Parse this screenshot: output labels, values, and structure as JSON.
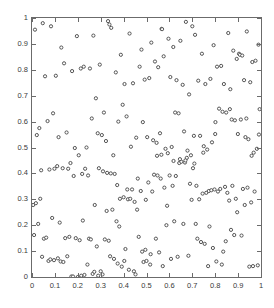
{
  "chart_data": {
    "type": "scatter",
    "title": "",
    "subtitle": "",
    "xlabel": "",
    "ylabel": "",
    "xlim": [
      0,
      1
    ],
    "ylim": [
      0,
      1
    ],
    "grid": false,
    "legend": null,
    "frame": "box",
    "tick_direction": "in",
    "marker": {
      "shape": "circle-open",
      "size_px": 3.2,
      "edge_color": "#555555",
      "face_color": "#ffffff",
      "edge_width": 1.0
    },
    "xticks": [
      0,
      0.1,
      0.2,
      0.3,
      0.4,
      0.5,
      0.6,
      0.7,
      0.8,
      0.9,
      1
    ],
    "yticks": [
      0,
      0.1,
      0.2,
      0.3,
      0.4,
      0.5,
      0.6,
      0.7,
      0.8,
      0.9,
      1
    ],
    "xticklabels": [
      "0",
      "0.1",
      "0.2",
      "0.3",
      "0.4",
      "0.5",
      "0.6",
      "0.7",
      "0.8",
      "0.9",
      "1"
    ],
    "yticklabels": [
      "0",
      "0.1",
      "0.2",
      "0.3",
      "0.4",
      "0.5",
      "0.6",
      "0.7",
      "0.8",
      "0.9",
      "1"
    ],
    "n_points": 252,
    "series": [
      {
        "name": "random-uniform-points",
        "x": [
          0.013,
          0.047,
          0.083,
          0.128,
          0.196,
          0.213,
          0.268,
          0.296,
          0.332,
          0.338,
          0.346,
          0.388,
          0.426,
          0.478,
          0.521,
          0.566,
          0.568,
          0.596,
          0.617,
          0.648,
          0.672,
          0.7,
          0.712,
          0.742,
          0.793,
          0.826,
          0.857,
          0.879,
          0.904,
          0.908,
          0.918,
          0.938,
          0.962,
          0.989,
          0.021,
          0.057,
          0.104,
          0.14,
          0.175,
          0.226,
          0.253,
          0.279,
          0.314,
          0.366,
          0.404,
          0.441,
          0.47,
          0.492,
          0.512,
          0.537,
          0.551,
          0.575,
          0.604,
          0.631,
          0.658,
          0.686,
          0.726,
          0.757,
          0.779,
          0.808,
          0.838,
          0.866,
          0.894,
          0.926,
          0.953,
          0.976,
          0.032,
          0.068,
          0.092,
          0.116,
          0.151,
          0.187,
          0.204,
          0.238,
          0.261,
          0.287,
          0.305,
          0.323,
          0.355,
          0.377,
          0.396,
          0.413,
          0.432,
          0.455,
          0.484,
          0.503,
          0.529,
          0.544,
          0.559,
          0.583,
          0.61,
          0.625,
          0.64,
          0.664,
          0.679,
          0.694,
          0.707,
          0.734,
          0.75,
          0.765,
          0.786,
          0.801,
          0.817,
          0.832,
          0.848,
          0.872,
          0.886,
          0.899,
          0.912,
          0.932,
          0.945,
          0.968,
          0.982,
          0.005,
          0.04,
          0.076,
          0.098,
          0.11,
          0.134,
          0.158,
          0.168,
          0.182,
          0.219,
          0.232,
          0.245,
          0.274,
          0.292,
          0.31,
          0.328,
          0.344,
          0.361,
          0.372,
          0.384,
          0.4,
          0.419,
          0.437,
          0.448,
          0.462,
          0.475,
          0.497,
          0.508,
          0.525,
          0.533,
          0.548,
          0.562,
          0.578,
          0.59,
          0.601,
          0.614,
          0.628,
          0.643,
          0.652,
          0.668,
          0.676,
          0.69,
          0.703,
          0.718,
          0.73,
          0.745,
          0.761,
          0.772,
          0.783,
          0.797,
          0.812,
          0.822,
          0.843,
          0.853,
          0.861,
          0.875,
          0.89,
          0.921,
          0.941,
          0.957,
          0.972,
          0.994,
          0.009,
          0.027,
          0.052,
          0.062,
          0.088,
          0.121,
          0.145,
          0.163,
          0.191,
          0.208,
          0.222,
          0.249,
          0.257,
          0.283,
          0.3,
          0.318,
          0.335,
          0.351,
          0.369,
          0.381,
          0.392,
          0.408,
          0.423,
          0.445,
          0.452,
          0.466,
          0.487,
          0.5,
          0.516,
          0.541,
          0.555,
          0.571,
          0.587,
          0.607,
          0.621,
          0.636,
          0.661,
          0.683,
          0.697,
          0.715,
          0.722,
          0.738,
          0.754,
          0.769,
          0.775,
          0.79,
          0.805,
          0.829,
          0.835,
          0.846,
          0.869,
          0.883,
          0.896,
          0.915,
          0.929,
          0.949,
          0.965,
          0.986,
          0.017,
          0.036,
          0.044,
          0.072,
          0.08,
          0.096,
          0.113,
          0.125,
          0.137,
          0.154,
          0.172,
          0.179,
          0.2,
          0.215,
          0.229,
          0.242,
          0.265,
          0.272,
          0.289,
          0.308,
          0.326,
          0.341,
          0.358,
          0.374,
          0.403,
          0.416,
          0.429,
          0.459,
          0.481,
          0.495,
          0.518,
          0.546,
          0.565,
          0.593,
          0.618,
          0.646,
          0.67,
          0.709,
          0.748,
          0.8,
          0.864,
          0.936,
          0.959,
          0.991
        ],
        "y": [
          0.955,
          0.98,
          0.968,
          0.886,
          0.93,
          0.805,
          0.932,
          0.82,
          0.988,
          0.975,
          0.962,
          0.858,
          0.94,
          0.878,
          0.905,
          0.958,
          0.957,
          0.92,
          0.888,
          0.912,
          0.985,
          0.968,
          0.935,
          0.862,
          0.895,
          0.815,
          0.942,
          0.874,
          0.862,
          0.858,
          0.855,
          0.948,
          0.83,
          0.897,
          0.548,
          0.775,
          0.777,
          0.825,
          0.795,
          0.812,
          0.805,
          0.69,
          0.635,
          0.79,
          0.745,
          0.748,
          0.812,
          0.762,
          0.768,
          0.832,
          0.81,
          0.852,
          0.772,
          0.76,
          0.742,
          0.705,
          0.758,
          0.745,
          0.765,
          0.812,
          0.745,
          0.725,
          0.842,
          0.76,
          0.752,
          0.835,
          0.575,
          0.602,
          0.632,
          0.54,
          0.558,
          0.498,
          0.47,
          0.5,
          0.612,
          0.555,
          0.548,
          0.525,
          0.47,
          0.6,
          0.665,
          0.62,
          0.503,
          0.538,
          0.598,
          0.54,
          0.528,
          0.518,
          0.555,
          0.495,
          0.502,
          0.635,
          0.632,
          0.562,
          0.488,
          0.47,
          0.545,
          0.545,
          0.505,
          0.492,
          0.52,
          0.598,
          0.65,
          0.638,
          0.635,
          0.608,
          0.605,
          0.552,
          0.608,
          0.54,
          0.532,
          0.48,
          0.495,
          0.278,
          0.412,
          0.415,
          0.418,
          0.428,
          0.42,
          0.418,
          0.44,
          0.39,
          0.398,
          0.418,
          0.392,
          0.278,
          0.42,
          0.408,
          0.402,
          0.4,
          0.398,
          0.355,
          0.302,
          0.308,
          0.3,
          0.338,
          0.29,
          0.38,
          0.332,
          0.298,
          0.365,
          0.33,
          0.395,
          0.392,
          0.38,
          0.345,
          0.275,
          0.392,
          0.352,
          0.39,
          0.44,
          0.445,
          0.442,
          0.46,
          0.36,
          0.42,
          0.352,
          0.3,
          0.322,
          0.325,
          0.332,
          0.335,
          0.338,
          0.33,
          0.34,
          0.348,
          0.325,
          0.295,
          0.352,
          0.302,
          0.34,
          0.345,
          0.288,
          0.33,
          0.648,
          0.162,
          0.205,
          0.148,
          0.152,
          0.228,
          0.21,
          0.15,
          0.155,
          0.15,
          0.142,
          0.218,
          0.148,
          0.145,
          0.118,
          0.022,
          0.145,
          0.14,
          0.26,
          0.215,
          0.195,
          0.04,
          0.108,
          0.028,
          0.022,
          0.01,
          0.155,
          0.058,
          0.062,
          0.048,
          0.148,
          0.095,
          0.042,
          0.2,
          0.07,
          0.215,
          0.078,
          0.205,
          0.082,
          0.298,
          0.205,
          0.148,
          0.135,
          0.128,
          0.042,
          0.195,
          0.112,
          0.06,
          0.048,
          0.098,
          0.138,
          0.182,
          0.162,
          0.25,
          0.16,
          0.278,
          0.04,
          0.042,
          0.045,
          0.285,
          0.302,
          0.078,
          0.062,
          0.068,
          0.065,
          0.072,
          0.06,
          0.058,
          0.08,
          0.002,
          0.002,
          0.0,
          0.005,
          0.008,
          0.048,
          0.012,
          0.02,
          0.005,
          0.01,
          0.255,
          0.08,
          0.07,
          0.052,
          0.062,
          0.338,
          0.302,
          0.26,
          0.098,
          0.105,
          0.088,
          0.468,
          0.472,
          0.478,
          0.448,
          0.455,
          0.45,
          0.438,
          0.48,
          0.552,
          0.648,
          0.612,
          0.468,
          0.55
        ]
      }
    ]
  }
}
